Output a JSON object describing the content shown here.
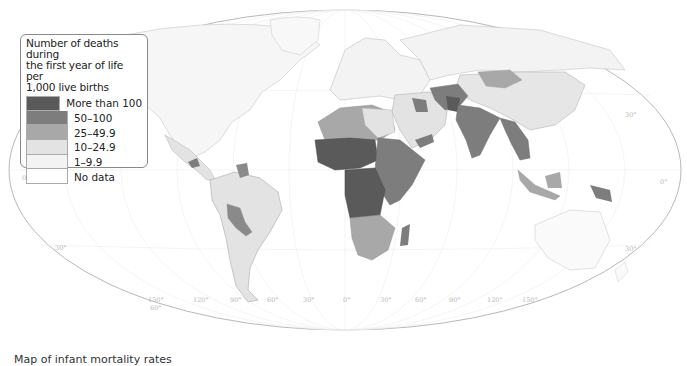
{
  "map": {
    "projection": "elliptical world map",
    "colors": {
      "more_than_100": "#5a5a5a",
      "50_100": "#7d7d7d",
      "25_49_9": "#a8a8a8",
      "10_24_9": "#e3e3e3",
      "1_9_9": "#f3f3f3",
      "no_data": "#ffffff",
      "outline": "#b5b5b5"
    },
    "legend": {
      "title": "Number of deaths during the first year of life per 1,000 live births",
      "title_lines": [
        "Number of deaths during",
        "the first year of life per",
        "1,000 live births"
      ],
      "items": [
        {
          "label": "More than 100",
          "color": "#5a5a5a"
        },
        {
          "label": "50–100",
          "color": "#7d7d7d"
        },
        {
          "label": "25–49.9",
          "color": "#a8a8a8"
        },
        {
          "label": "10–24.9",
          "color": "#e3e3e3"
        },
        {
          "label": "1–9.9",
          "color": "#f3f3f3"
        },
        {
          "label": "No data",
          "color": "#ffffff"
        }
      ]
    },
    "grid_labels": {
      "longitudes": [
        "150°",
        "120°",
        "90°",
        "60°",
        "30°",
        "0°",
        "30°",
        "60°",
        "90°",
        "120°",
        "150°"
      ],
      "latitudes_left": [
        "0°",
        "30°",
        "60°"
      ],
      "latitudes_right": [
        "30°",
        "0°",
        "30°"
      ]
    },
    "bottom_text": "Map of infant mortality rates"
  }
}
